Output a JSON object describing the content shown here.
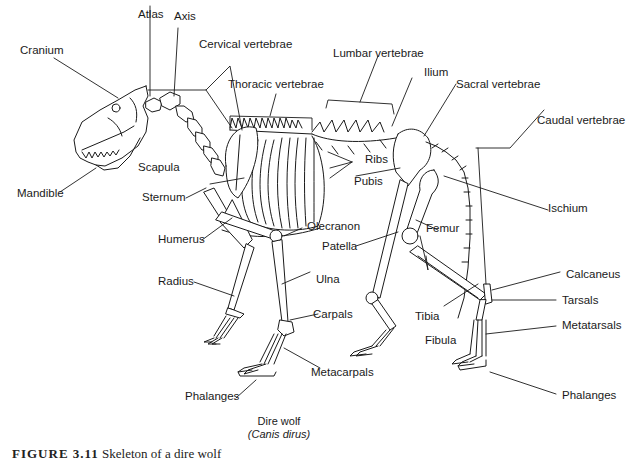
{
  "figure": {
    "title": "Dire wolf",
    "subtitle": "(Canis dirus)",
    "caption_label": "FIGURE 3.11",
    "caption_text": "Skeleton of a dire wolf"
  },
  "labels": {
    "atlas": "Atlas",
    "axis": "Axis",
    "cranium": "Cranium",
    "cervical": "Cervical vertebrae",
    "thoracic": "Thoracic vertebrae",
    "lumbar": "Lumbar vertebrae",
    "ilium": "Ilium",
    "sacral": "Sacral vertebrae",
    "caudal": "Caudal vertebrae",
    "ribs": "Ribs",
    "pubis": "Pubis",
    "ischium": "Ischium",
    "scapula": "Scapula",
    "sternum": "Sternum",
    "mandible": "Mandible",
    "humerus": "Humerus",
    "olecranon": "Olecranon",
    "patella": "Patella",
    "femur": "Femur",
    "radius": "Radius",
    "ulna": "Ulna",
    "carpals": "Carpals",
    "metacarpals": "Metacarpals",
    "phalanges_front": "Phalanges",
    "tibia": "Tibia",
    "fibula": "Fibula",
    "calcaneus": "Calcaneus",
    "tarsals": "Tarsals",
    "metatarsals": "Metatarsals",
    "phalanges_hind": "Phalanges"
  },
  "colors": {
    "line": "#1a1a1a",
    "background": "#ffffff"
  }
}
